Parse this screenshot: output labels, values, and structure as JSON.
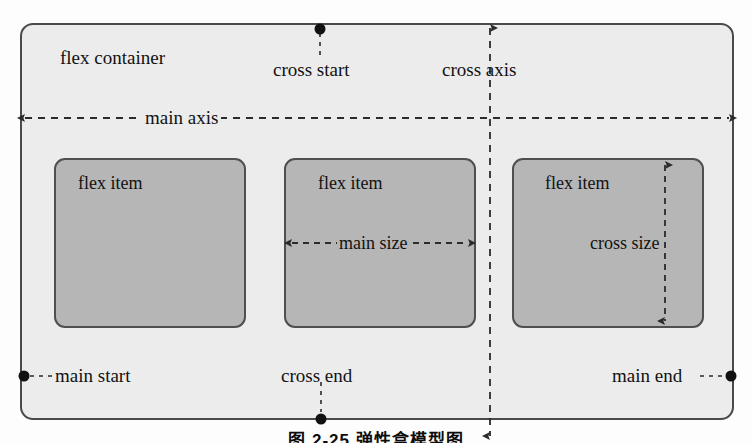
{
  "figure": {
    "caption": "图 2-25  弹性盒模型图",
    "container_label": "flex container",
    "colors": {
      "container_fill": "#ececec",
      "container_stroke": "#4a4a4a",
      "item_fill": "#b6b6b6",
      "item_stroke": "#4f4f4f",
      "line": "#2b2b2b",
      "text": "#121212",
      "page_background": "#fdfdfd"
    },
    "items": [
      {
        "label": "flex item"
      },
      {
        "label": "flex item"
      },
      {
        "label": "flex item"
      }
    ],
    "axes": [
      {
        "name": "main axis",
        "label": "main axis",
        "orientation": "horizontal",
        "arrows": "both"
      },
      {
        "name": "cross axis",
        "label": "cross axis",
        "orientation": "vertical",
        "arrows": "both"
      }
    ],
    "markers": [
      {
        "name": "cross start",
        "label": "cross start"
      },
      {
        "name": "cross end",
        "label": "cross end"
      },
      {
        "name": "main start",
        "label": "main start"
      },
      {
        "name": "main end",
        "label": "main end"
      }
    ],
    "measures": [
      {
        "name": "main size",
        "label": "main size",
        "orientation": "horizontal"
      },
      {
        "name": "cross size",
        "label": "cross size",
        "orientation": "vertical"
      }
    ]
  }
}
